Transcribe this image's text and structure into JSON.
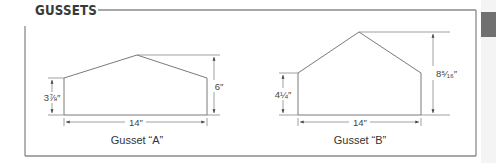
{
  "header": {
    "title": "GUSSETS"
  },
  "colors": {
    "line": "#7a7a7a",
    "frame": "#8a8a8a",
    "text": "#333333",
    "side_tab": "#707070",
    "side_strip": "#f4f4f4"
  },
  "gussets": [
    {
      "id": "A",
      "caption": "Gusset “A”",
      "width_label": "14″",
      "left_height_label": "3⅞″",
      "peak_height_label": "6″"
    },
    {
      "id": "B",
      "caption": "Gusset “B”",
      "width_label": "14″",
      "left_height_label": "4¼″",
      "peak_height_label": "8⁵⁄₁₆″"
    }
  ]
}
